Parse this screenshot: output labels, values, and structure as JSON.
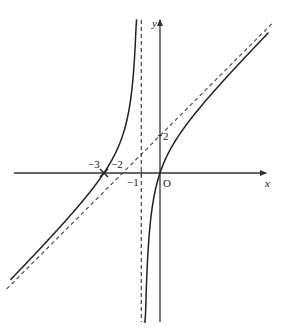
{
  "figure": {
    "width": 285,
    "height": 334,
    "origin_px": [
      160,
      173
    ],
    "unit_px": 18.7,
    "colors": {
      "axis": "#333333",
      "curve": "#222222",
      "asymptote": "#444444",
      "text": "#222222"
    }
  },
  "labels": {
    "x_axis": "x",
    "y_axis": "y",
    "origin": "O",
    "tick_neg3": "−3",
    "tick_neg2": "−2",
    "tick_neg1": "−1",
    "tick_y2": "2"
  },
  "chart_data": {
    "type": "line",
    "title": "",
    "xlabel": "x",
    "ylabel": "y",
    "function": "y = x + 2 - 2/(x+1)",
    "xlim": [
      -8.5,
      6.5
    ],
    "ylim": [
      -8,
      8.2
    ],
    "grid": false,
    "series": [
      {
        "name": "curve-left-branch",
        "style": "solid",
        "x_range": [
          -8.0,
          -1.22
        ]
      },
      {
        "name": "curve-right-branch",
        "style": "solid",
        "x_range": [
          -0.87,
          5.8
        ]
      },
      {
        "name": "oblique-asymptote",
        "style": "dashed",
        "equation": "y = x + 2",
        "x_range": [
          -8.2,
          6.0
        ]
      },
      {
        "name": "vertical-asymptote",
        "style": "dashed",
        "equation": "x = -1"
      }
    ],
    "annotations": [
      {
        "text": "−3",
        "x": -3,
        "y": 0,
        "note": "x-intercept of curve and asymptote intersection marker"
      },
      {
        "text": "−2",
        "x": -2,
        "y": 0,
        "note": "x-intercept of y = x + 2"
      },
      {
        "text": "−1",
        "x": -1,
        "y": 0
      },
      {
        "text": "2",
        "x": 0,
        "y": 2,
        "note": "y-intercept of y = x + 2"
      },
      {
        "text": "O",
        "x": 0,
        "y": 0
      }
    ]
  }
}
